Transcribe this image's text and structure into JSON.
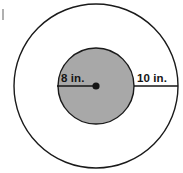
{
  "figure": {
    "name": "concentric-circles-diagram",
    "background_color": "#ffffff",
    "stroke_color": "#1a1a1a",
    "inner_fill_color": "#a8a8a8",
    "center": {
      "x": 96,
      "y": 86
    },
    "outer_circle": {
      "radius_px": 82,
      "fill": "none",
      "stroke_width": 1.4
    },
    "inner_circle": {
      "radius_px": 38,
      "fill": "#a8a8a8",
      "stroke_width": 1.4
    },
    "center_dot": {
      "radius_px": 3.6,
      "fill": "#151515"
    },
    "measurements": [
      {
        "id": "inner-radius",
        "label": "8 in.",
        "value": 8,
        "unit": "in.",
        "describes": "radius of inner shaded circle",
        "line": {
          "x1": 57,
          "y1": 86,
          "x2": 96,
          "y2": 86
        },
        "label_position": {
          "x": 61,
          "y": 82
        }
      },
      {
        "id": "outer-ring-width",
        "label": "10 in.",
        "value": 10,
        "unit": "in.",
        "describes": "distance from inner circle edge to outer circle",
        "line": {
          "x1": 134,
          "y1": 86,
          "x2": 178,
          "y2": 86
        },
        "label_position": {
          "x": 137,
          "y": 82
        }
      }
    ],
    "stray_mark": {
      "x": 2,
      "y": 9,
      "width": 2,
      "height": 11
    }
  }
}
